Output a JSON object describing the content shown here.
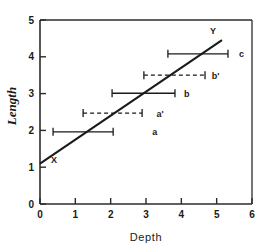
{
  "chart_data": {
    "type": "scatter",
    "title": "",
    "xlabel": "Depth",
    "ylabel": "Length",
    "xlim": [
      0,
      6
    ],
    "ylim": [
      0,
      5
    ],
    "xticks": [
      0,
      1,
      2,
      3,
      4,
      5,
      6
    ],
    "yticks": [
      0,
      1,
      2,
      3,
      4,
      5
    ],
    "xtick_labels": [
      "0",
      "1",
      "2",
      "3",
      "4",
      "5",
      "6"
    ],
    "ytick_labels": [
      "0",
      "1",
      "2",
      "3",
      "4",
      "5"
    ],
    "grid": false,
    "legend": "none",
    "trend_line": {
      "name": "regression-line",
      "start_label": "X",
      "end_label": "Y",
      "start": [
        0.0,
        1.1
      ],
      "end": [
        5.15,
        4.45
      ]
    },
    "series": [
      {
        "name": "a",
        "label": "a",
        "style": "solid",
        "y": 1.96,
        "x_low": 0.37,
        "x_high": 2.07,
        "label_x": 3.25
      },
      {
        "name": "a-prime",
        "label": "a'",
        "style": "dashed",
        "y": 2.47,
        "x_low": 1.22,
        "x_high": 2.89,
        "label_x": 3.4
      },
      {
        "name": "b",
        "label": "b",
        "style": "solid",
        "y": 3.01,
        "x_low": 2.04,
        "x_high": 3.82,
        "label_x": 4.15
      },
      {
        "name": "b-prime",
        "label": "b'",
        "style": "dashed",
        "y": 3.5,
        "x_low": 2.94,
        "x_high": 4.67,
        "label_x": 4.97
      },
      {
        "name": "c",
        "label": "c",
        "style": "solid",
        "y": 4.08,
        "x_low": 3.62,
        "x_high": 5.32,
        "label_x": 5.7
      }
    ]
  }
}
